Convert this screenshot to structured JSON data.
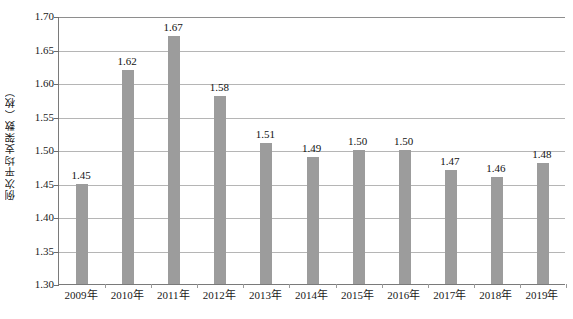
{
  "chart_data": {
    "type": "bar",
    "title": "",
    "subtitle": "",
    "xlabel": "",
    "ylabel": "例次平均支架数（枚）",
    "categories": [
      "2009年",
      "2010年",
      "2011年",
      "2012年",
      "2013年",
      "2014年",
      "2015年",
      "2016年",
      "2017年",
      "2018年",
      "2019年"
    ],
    "values": [
      1.45,
      1.62,
      1.67,
      1.58,
      1.51,
      1.49,
      1.5,
      1.5,
      1.47,
      1.46,
      1.48
    ],
    "value_labels": [
      "1.45",
      "1.62",
      "1.67",
      "1.58",
      "1.51",
      "1.49",
      "1.50",
      "1.50",
      "1.47",
      "1.46",
      "1.48"
    ],
    "ylim": [
      1.3,
      1.7
    ],
    "ytick_values": [
      1.3,
      1.35,
      1.4,
      1.45,
      1.5,
      1.55,
      1.6,
      1.65,
      1.7
    ],
    "ytick_labels": [
      "1.30",
      "1.35",
      "1.40",
      "1.45",
      "1.50",
      "1.55",
      "1.60",
      "1.65",
      "1.70"
    ],
    "grid": true,
    "grid_axis": "y",
    "legend": false,
    "legend_position": "none",
    "series_name": "例次平均支架数",
    "bar_color": "#9c9c9c",
    "gridline_color": "#b5b5b5",
    "axis_color": "#7a7a7a",
    "background_color": "#ffffff",
    "text_color": "#1a1a1a"
  }
}
